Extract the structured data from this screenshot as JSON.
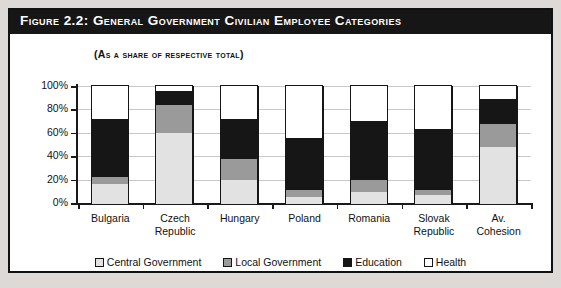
{
  "figure": {
    "title": "Figure 2.2: General Government Civilian Employee Categories",
    "subtitle": "(As a share of respective total)"
  },
  "axis": {
    "y_ticks": [
      "100%",
      "80%",
      "60%",
      "40%",
      "20%",
      "0%"
    ]
  },
  "legend": {
    "items": [
      {
        "label": "Central Government",
        "color": "#e2e2e2",
        "swatch": "legend-swatch-central-government"
      },
      {
        "label": "Local Government",
        "color": "#9a9a9a",
        "swatch": "legend-swatch-local-government"
      },
      {
        "label": "Education",
        "color": "#161616",
        "swatch": "legend-swatch-education"
      },
      {
        "label": "Health",
        "color": "#ffffff",
        "swatch": "legend-swatch-health"
      }
    ]
  },
  "categories_display": [
    {
      "line1": "Bulgaria",
      "line2": ""
    },
    {
      "line1": "Czech",
      "line2": "Republic"
    },
    {
      "line1": "Hungary",
      "line2": ""
    },
    {
      "line1": "Poland",
      "line2": ""
    },
    {
      "line1": "Romania",
      "line2": ""
    },
    {
      "line1": "Slovak",
      "line2": "Republic"
    },
    {
      "line1": "Av.",
      "line2": "Cohesion"
    }
  ],
  "chart_data": {
    "type": "bar",
    "subtype": "stacked-bar-100-percent",
    "title": "Figure 2.2: General Government Civilian Employee Categories",
    "subtitle": "(As a share of respective total)",
    "xlabel": "",
    "ylabel": "",
    "ylim": [
      0,
      100
    ],
    "ytick_values": [
      0,
      20,
      40,
      60,
      80,
      100
    ],
    "ytick_labels": [
      "0%",
      "20%",
      "40%",
      "60%",
      "80%",
      "100%"
    ],
    "grid": true,
    "legend_position": "bottom-center",
    "categories": [
      "Bulgaria",
      "Czech Republic",
      "Hungary",
      "Poland",
      "Romania",
      "Slovak Republic",
      "Av. Cohesion"
    ],
    "series": [
      {
        "name": "Central Government",
        "color": "#e2e2e2",
        "values": [
          17,
          60,
          20,
          6,
          10,
          7,
          48
        ]
      },
      {
        "name": "Local Government",
        "color": "#9a9a9a",
        "values": [
          6,
          24,
          18,
          6,
          10,
          5,
          20
        ]
      },
      {
        "name": "Education",
        "color": "#161616",
        "values": [
          49,
          12,
          34,
          44,
          51,
          52,
          21
        ]
      },
      {
        "name": "Health",
        "color": "#ffffff",
        "values": [
          28,
          4,
          28,
          44,
          29,
          36,
          11
        ]
      }
    ]
  }
}
